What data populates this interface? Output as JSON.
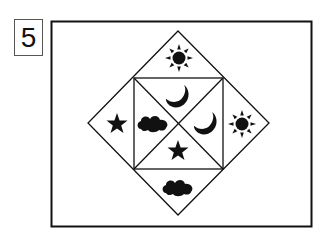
{
  "puzzle": {
    "number": "5",
    "colors": {
      "stroke": "#111111",
      "fill": "#111111",
      "background": "#ffffff"
    },
    "cells": [
      {
        "position": "top",
        "icon": "sun-icon"
      },
      {
        "position": "left",
        "icon": "star-icon"
      },
      {
        "position": "right",
        "icon": "sun-icon"
      },
      {
        "position": "bottom",
        "icon": "cloud-icon"
      },
      {
        "position": "inner-top",
        "icon": "moon-icon"
      },
      {
        "position": "inner-left",
        "icon": "cloud-icon"
      },
      {
        "position": "inner-right",
        "icon": "moon-icon"
      },
      {
        "position": "inner-bottom",
        "icon": "star-icon"
      }
    ]
  }
}
